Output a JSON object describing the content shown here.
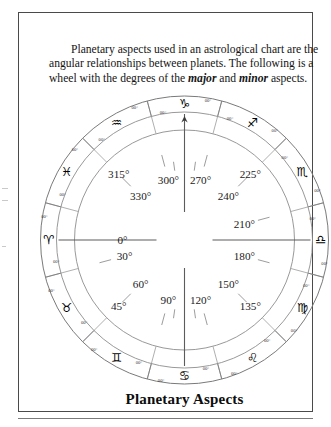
{
  "document": {
    "caption": "Planetary Aspects",
    "intro_paragraph": {
      "part1": "Planetary aspects used in an astrological chart are the angular relationships between planets. The following is a wheel with the degrees of the ",
      "emphasis1": "major",
      "joiner": " and ",
      "emphasis2": "minor",
      "part2": " aspects."
    }
  },
  "wheel": {
    "type": "astrological-aspect-wheel",
    "center_label": "",
    "degree_marker_small": "00°",
    "outer_signs": [
      {
        "name": "Aries",
        "glyph": "♈",
        "angle_deg": 180,
        "sector_degree": "0°"
      },
      {
        "name": "Taurus",
        "glyph": "♉",
        "angle_deg": 210,
        "sector_degree": "30°"
      },
      {
        "name": "Gemini",
        "glyph": "♊",
        "angle_deg": 240,
        "sector_degree": "60°"
      },
      {
        "name": "Cancer",
        "glyph": "♋",
        "angle_deg": 270,
        "sector_degree": "90°"
      },
      {
        "name": "Leo",
        "glyph": "♌",
        "angle_deg": 300,
        "sector_degree": "120°"
      },
      {
        "name": "Virgo",
        "glyph": "♍",
        "angle_deg": 330,
        "sector_degree": "150°"
      },
      {
        "name": "Libra",
        "glyph": "♎",
        "angle_deg": 0,
        "sector_degree": "180°"
      },
      {
        "name": "Scorpio",
        "glyph": "♏",
        "angle_deg": 30,
        "sector_degree": "210°"
      },
      {
        "name": "Sagittarius",
        "glyph": "♐",
        "angle_deg": 60,
        "sector_degree": "240°"
      },
      {
        "name": "Capricorn",
        "glyph": "♑",
        "angle_deg": 90,
        "sector_degree": "270°"
      },
      {
        "name": "Aquarius",
        "glyph": "♒",
        "angle_deg": 120,
        "sector_degree": "300°"
      },
      {
        "name": "Pisces",
        "glyph": "♓",
        "angle_deg": 150,
        "sector_degree": "330°"
      }
    ],
    "degree_labels_inner": [
      {
        "text": "0°",
        "angle_deg": 180
      },
      {
        "text": "30°",
        "angle_deg": 195
      },
      {
        "text": "60°",
        "angle_deg": 225
      },
      {
        "text": "90°",
        "angle_deg": 255
      },
      {
        "text": "120°",
        "angle_deg": 285
      },
      {
        "text": "150°",
        "angle_deg": 315
      },
      {
        "text": "180°",
        "angle_deg": 345
      },
      {
        "text": "210°",
        "angle_deg": 15
      },
      {
        "text": "240°",
        "angle_deg": 45
      },
      {
        "text": "270°",
        "angle_deg": 75
      },
      {
        "text": "300°",
        "angle_deg": 105
      },
      {
        "text": "330°",
        "angle_deg": 135
      }
    ],
    "sector_labels_outer": [
      {
        "text": "315°",
        "angle_deg": 135
      },
      {
        "text": "225°",
        "angle_deg": 45
      },
      {
        "text": "45°",
        "angle_deg": 225
      },
      {
        "text": "135°",
        "angle_deg": 315
      }
    ],
    "axes": [
      {
        "name": "aries-libra-axis",
        "from_deg": 180,
        "to_deg": 0
      },
      {
        "name": "capricorn-cancer-axis",
        "from_deg": 90,
        "to_deg": 270
      }
    ],
    "colors": {
      "frame": "#4a4a4a",
      "ring": "#8d8d8d",
      "spoke": "#9a9a9a",
      "text": "#1b1b1b",
      "glyph": "#000000",
      "background": "#ffffff"
    }
  }
}
